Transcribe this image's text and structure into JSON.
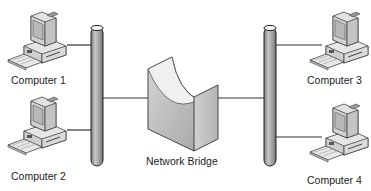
{
  "diagram": {
    "nodes": [
      {
        "id": "computer1",
        "label": "Computer 1",
        "type": "computer-icon",
        "segment": "left"
      },
      {
        "id": "computer2",
        "label": "Computer 2",
        "type": "computer-icon",
        "segment": "left"
      },
      {
        "id": "computer3",
        "label": "Computer 3",
        "type": "computer-icon",
        "segment": "right"
      },
      {
        "id": "computer4",
        "label": "Computer 4",
        "type": "computer-icon",
        "segment": "right"
      },
      {
        "id": "bridge",
        "label": "Network Bridge",
        "type": "bridge-icon"
      }
    ],
    "segments": [
      {
        "id": "left-bus",
        "type": "cable-pipe"
      },
      {
        "id": "right-bus",
        "type": "cable-pipe"
      }
    ],
    "edges": [
      {
        "from": "computer1",
        "to": "left-bus"
      },
      {
        "from": "computer2",
        "to": "left-bus"
      },
      {
        "from": "left-bus",
        "to": "bridge"
      },
      {
        "from": "bridge",
        "to": "right-bus"
      },
      {
        "from": "right-bus",
        "to": "computer3"
      },
      {
        "from": "right-bus",
        "to": "computer4"
      }
    ],
    "colors": {
      "pipe": "#9a9a9a",
      "line": "#333333",
      "bridge": "#bdbdbd"
    }
  }
}
